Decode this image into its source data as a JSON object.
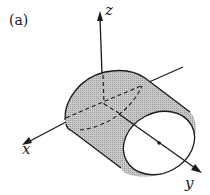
{
  "figure": {
    "panel_label": "(a)",
    "axes": {
      "x_label": "x",
      "y_label": "y",
      "z_label": "z"
    },
    "colors": {
      "stroke": "#1a1a1a",
      "surface_fill": "#bdbdbd",
      "background": "#ffffff"
    }
  }
}
